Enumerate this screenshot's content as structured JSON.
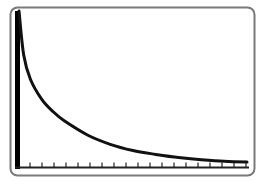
{
  "chart_data": {
    "type": "line",
    "title": "",
    "xlabel": "",
    "ylabel": "",
    "grid": false,
    "legend": null,
    "x_ticks_count": 19,
    "tick_labels": [],
    "x": [
      0.0,
      0.02,
      0.05,
      0.1,
      0.15,
      0.2,
      0.3,
      0.4,
      0.5,
      0.6,
      0.7,
      0.8,
      0.9,
      1.0
    ],
    "values": [
      1.0,
      0.72,
      0.56,
      0.43,
      0.35,
      0.29,
      0.2,
      0.14,
      0.1,
      0.075,
      0.055,
      0.04,
      0.03,
      0.025
    ],
    "xlim": [
      0,
      1
    ],
    "ylim": [
      0,
      1
    ]
  },
  "colors": {
    "frame": "#7a7a7a",
    "axis": "#000000",
    "curve": "#111111",
    "background": "#ffffff"
  }
}
